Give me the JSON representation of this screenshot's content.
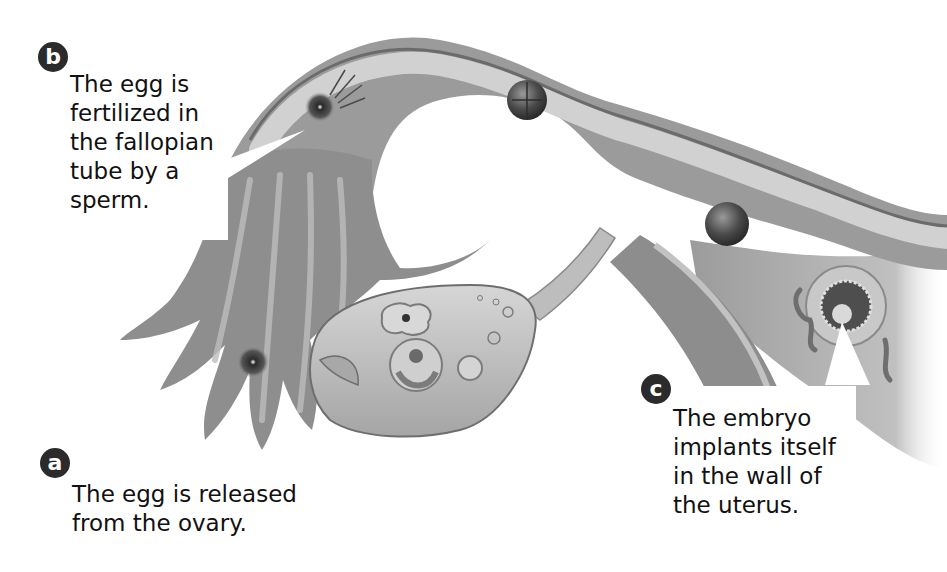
{
  "diagram": {
    "colors": {
      "background": "#ffffff",
      "tissue_dark": "#6e6e6e",
      "tissue_mid": "#9a9a9a",
      "tissue_light": "#c9c9c9",
      "badge": "#2b2b2b",
      "text": "#111111"
    },
    "labels": [
      {
        "id": "b",
        "badge": "b",
        "text": "The egg is\nfertilized in\nthe fallopian\ntube by a\nsperm."
      },
      {
        "id": "a",
        "badge": "a",
        "text": "The egg is released\nfrom the ovary."
      },
      {
        "id": "c",
        "badge": "c",
        "text": "The embryo\nimplants itself\nin the wall of\nthe uterus."
      }
    ],
    "structures": [
      {
        "name": "fallopian-tube"
      },
      {
        "name": "fimbriae"
      },
      {
        "name": "ovary"
      },
      {
        "name": "ovarian-ligament"
      },
      {
        "name": "uterus-wall"
      },
      {
        "name": "released-egg"
      },
      {
        "name": "fertilized-egg"
      },
      {
        "name": "dividing-cell-cluster"
      },
      {
        "name": "morula"
      },
      {
        "name": "implanted-embryo"
      }
    ]
  }
}
